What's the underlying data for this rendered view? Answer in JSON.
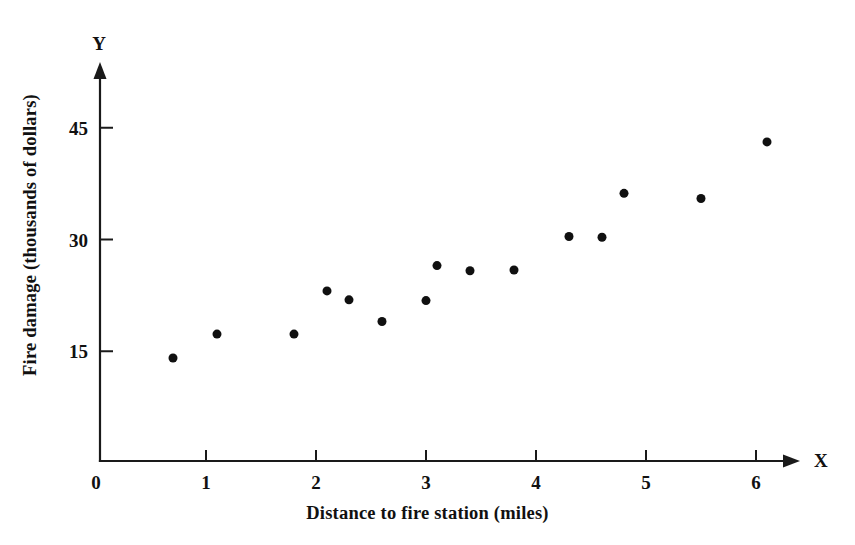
{
  "chart_data": {
    "type": "scatter",
    "title": "",
    "xlabel": "Distance to fire station (miles)",
    "ylabel": "Fire damage (thousands of dollars)",
    "x_axis_name": "X",
    "y_axis_name": "Y",
    "xlim": [
      0,
      6.55
    ],
    "ylim": [
      0,
      52
    ],
    "xticks": [
      0,
      1,
      2,
      3,
      4,
      5,
      6
    ],
    "xtick_labels": [
      "0",
      "1",
      "2",
      "3",
      "4",
      "5",
      "6"
    ],
    "yticks": [
      15,
      30,
      45
    ],
    "ytick_labels": [
      "15",
      "30",
      "45"
    ],
    "grid": false,
    "legend": false,
    "marker": "filled-circle",
    "marker_color": "#101010",
    "marker_size_px": 9,
    "x": [
      0.7,
      1.1,
      1.8,
      2.1,
      2.3,
      2.6,
      3.0,
      3.1,
      3.4,
      3.8,
      4.3,
      4.6,
      4.8,
      5.5,
      6.1
    ],
    "y": [
      14.1,
      17.3,
      17.3,
      23.1,
      21.9,
      19.0,
      21.8,
      26.5,
      25.8,
      25.9,
      30.4,
      30.3,
      36.2,
      35.5,
      43.1
    ],
    "points": [
      {
        "x": 0.7,
        "y": 14.1
      },
      {
        "x": 1.1,
        "y": 17.3
      },
      {
        "x": 1.8,
        "y": 17.3
      },
      {
        "x": 2.1,
        "y": 23.1
      },
      {
        "x": 2.3,
        "y": 21.9
      },
      {
        "x": 2.6,
        "y": 19.0
      },
      {
        "x": 3.0,
        "y": 21.8
      },
      {
        "x": 3.1,
        "y": 26.5
      },
      {
        "x": 3.4,
        "y": 25.8
      },
      {
        "x": 3.8,
        "y": 25.9
      },
      {
        "x": 4.3,
        "y": 30.4
      },
      {
        "x": 4.6,
        "y": 30.3
      },
      {
        "x": 4.8,
        "y": 36.2
      },
      {
        "x": 5.5,
        "y": 35.5
      },
      {
        "x": 6.1,
        "y": 43.1
      }
    ],
    "n_points": 15
  }
}
